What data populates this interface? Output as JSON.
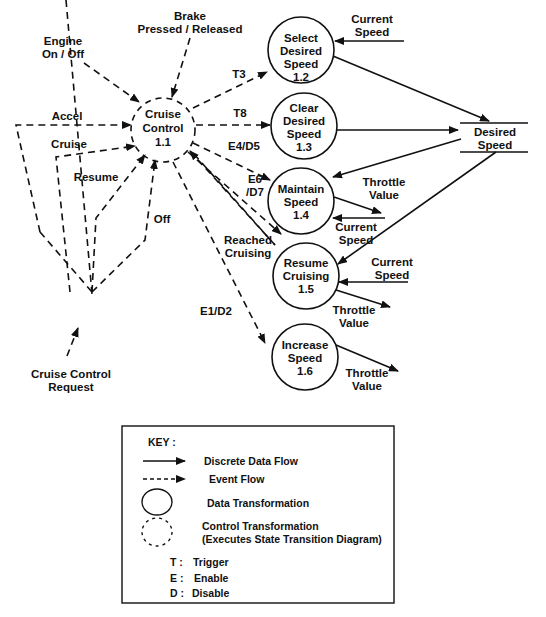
{
  "diagram": {
    "type": "data-flow / control-flow diagram",
    "control_transformation": {
      "name": "Cruise",
      "name2": "Control",
      "id": "1.1"
    },
    "processes": [
      {
        "line1": "Select",
        "line2": "Desired",
        "line3": "Speed",
        "id": "1.2"
      },
      {
        "line1": "Clear",
        "line2": "Desired",
        "line3": "Speed",
        "id": "1.3"
      },
      {
        "line1": "Maintain",
        "line2": "Speed",
        "id": "1.4"
      },
      {
        "line1": "Resume",
        "line2": "Cruising",
        "id": "1.5"
      },
      {
        "line1": "Increase",
        "line2": "Speed",
        "id": "1.6"
      }
    ],
    "data_store": {
      "line1": "Desired",
      "line2": "Speed"
    },
    "external_events": {
      "engine": {
        "line1": "Engine",
        "line2": "On / Off"
      },
      "brake": {
        "line1": "Brake",
        "line2": "Pressed / Released"
      },
      "accel": "Accel",
      "cruise": "Cruise",
      "resume": "Resume",
      "off": "Off",
      "request": {
        "line1": "Cruise Control",
        "line2": "Request"
      }
    },
    "event_labels": {
      "t3": "T3",
      "t8": "T8",
      "e4d5": "E4/D5",
      "e6": "E6",
      "d7": "/D7",
      "reached1": "Reached",
      "reached2": "Cruising",
      "e1d2": "E1/D2"
    },
    "data_labels": {
      "current": "Current",
      "speed": "Speed",
      "throttle": "Throttle",
      "value": "Value"
    }
  },
  "key": {
    "title": "KEY :",
    "items": [
      {
        "symbol": "solid-arrow",
        "label": "Discrete  Data Flow"
      },
      {
        "symbol": "dashed-arrow",
        "label": "Event Flow"
      },
      {
        "symbol": "solid-circle",
        "label": "Data Transformation"
      },
      {
        "symbol": "dashed-circle",
        "label": "Control Transformation",
        "label2": "(Executes State Transition Diagram)"
      }
    ],
    "abbreviations": [
      {
        "letter": "T :",
        "meaning": "Trigger"
      },
      {
        "letter": "E :",
        "meaning": "Enable"
      },
      {
        "letter": "D :",
        "meaning": "Disable"
      }
    ]
  }
}
